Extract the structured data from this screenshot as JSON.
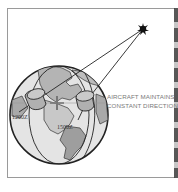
{
  "diagram": {
    "caption_lines": [
      "AIRCRAFT MAINTAINS",
      "CONSTANT DIRECTION"
    ],
    "time_labels": {
      "left_aircraft": "1200Z",
      "right_aircraft": "1500Z"
    },
    "elements": [
      "star",
      "globe",
      "gyro-left",
      "gyro-right",
      "sight-lines"
    ],
    "colors": {
      "ocean": "#e4e4e4",
      "land": "#a9a9a9",
      "outline": "#222222",
      "caption": "#7a7a7a"
    }
  }
}
